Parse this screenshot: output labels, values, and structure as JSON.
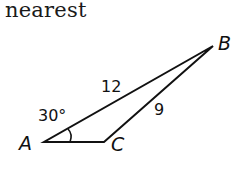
{
  "heading": {
    "text": "nearest"
  },
  "triangle": {
    "vertices": {
      "A": {
        "label": "A"
      },
      "B": {
        "label": "B"
      },
      "C": {
        "label": "C"
      }
    },
    "sides": {
      "AB": {
        "label": "12"
      },
      "BC": {
        "label": "9"
      }
    },
    "angles": {
      "A": {
        "label": "30°"
      }
    },
    "stroke_color": "#111111"
  }
}
